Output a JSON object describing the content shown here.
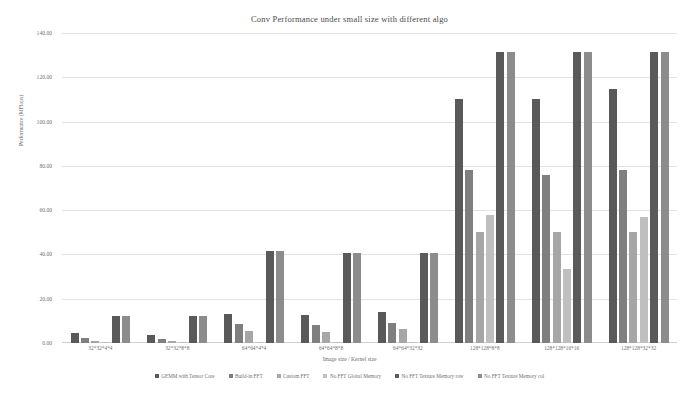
{
  "chart_data": {
    "type": "bar",
    "title": "Conv Performance under small size with different algo",
    "xlabel": "Image size / Kernel size",
    "ylabel": "Performance (MFlops)",
    "ylim": [
      0,
      140
    ],
    "yticks": [
      "0.00",
      "20.00",
      "40.00",
      "60.00",
      "80.00",
      "100.00",
      "120.00",
      "140.00"
    ],
    "grid": true,
    "legend_position": "bottom",
    "categories": [
      "32*32*4*4",
      "32*32*8*8",
      "64*64*4*4",
      "64*64*8*8",
      "64*64*32*32",
      "128*128*8*8",
      "128*128*16*16",
      "128*128*32*32"
    ],
    "series": [
      {
        "name": "GEMM with Tensor Core",
        "color": "#595959",
        "values": [
          4.5,
          3.6,
          13.0,
          12.8,
          13.8,
          110.0,
          110.0,
          114.5
        ]
      },
      {
        "name": "Build-in FFT",
        "color": "#7f7f7f",
        "values": [
          2.2,
          1.8,
          8.5,
          8.2,
          9.0,
          78.0,
          76.0,
          78.0
        ]
      },
      {
        "name": "Custom FFT",
        "color": "#a6a6a6",
        "values": [
          0.9,
          0.8,
          5.6,
          5.2,
          6.2,
          50.0,
          50.0,
          50.0
        ]
      },
      {
        "name": "No FFT Global Memory",
        "color": "#bfbfbf",
        "values": [
          0.6,
          0.5,
          0.5,
          0.5,
          0.5,
          58.0,
          33.5,
          57.0
        ]
      },
      {
        "name": "No FFT Texture Memory row",
        "color": "#5a5a5a",
        "values": [
          12.0,
          12.0,
          41.5,
          40.5,
          40.5,
          131.5,
          131.5,
          131.5
        ]
      },
      {
        "name": "No FFT Texture Memory col",
        "color": "#8c8c8c",
        "values": [
          12.0,
          12.0,
          41.5,
          40.5,
          40.5,
          131.5,
          131.5,
          131.5
        ]
      }
    ]
  }
}
